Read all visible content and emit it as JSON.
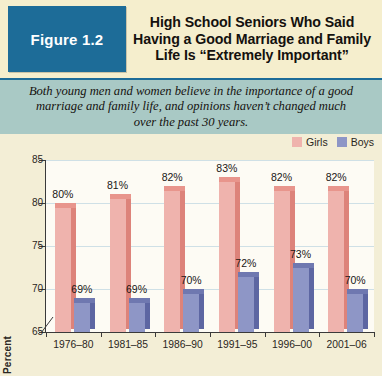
{
  "figure": {
    "badge_label": "Figure 1.2",
    "title_lines": [
      "High School Seniors Who Said",
      "Having a Good Marriage and Family",
      "Life Is “Extremely Important”"
    ],
    "subtitle_lines": [
      "Both young men and women believe in the importance of a good",
      "marriage and family life, and opinions haven’t changed much",
      "over the past 30 years."
    ]
  },
  "colors": {
    "badge_bg": "#1d6c98",
    "header_bg": "#f5eecd",
    "subtitle_bg": "#a9c9c5",
    "page_bg": "#f3eed6",
    "plot_bg": "#fdfbf4",
    "girls_front": "#efb3ad",
    "girls_side": "#dd837a",
    "girls_top": "#e8958c",
    "boys_front": "#8e96c6",
    "boys_side": "#5d66a2",
    "boys_top": "#6f78b0",
    "gridline": "#cfe0e6",
    "axis": "#3a3a3a"
  },
  "chart_data": {
    "type": "bar",
    "title": "High School Seniors Who Said Having a Good Marriage and Family Life Is “Extremely Important”",
    "subtitle": "Both young men and women believe in the importance of a good marriage and family life, and opinions haven’t changed much over the past 30 years.",
    "xlabel": "",
    "ylabel": "Percent",
    "ylim": [
      65,
      85
    ],
    "yticks": [
      65,
      70,
      75,
      80,
      85
    ],
    "ytick_labels": [
      "65",
      "70",
      "75",
      "80",
      "85"
    ],
    "grid": true,
    "axis_break": true,
    "legend_position": "top-right",
    "categories": [
      "1976–80",
      "1981–85",
      "1986–90",
      "1991–95",
      "1996–00",
      "2001–06"
    ],
    "series": [
      {
        "name": "Girls",
        "color": "#efb3ad",
        "values": [
          80,
          81,
          82,
          83,
          82,
          82
        ],
        "labels": [
          "80%",
          "81%",
          "82%",
          "83%",
          "82%",
          "82%"
        ]
      },
      {
        "name": "Boys",
        "color": "#8e96c6",
        "values": [
          69,
          69,
          70,
          72,
          73,
          70
        ],
        "labels": [
          "69%",
          "69%",
          "70%",
          "72%",
          "73%",
          "70%"
        ]
      }
    ]
  }
}
